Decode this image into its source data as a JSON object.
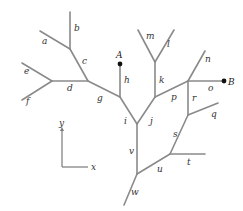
{
  "diagram": {
    "title": "",
    "colors": {
      "edge": "#8a8a8a",
      "point": "#111111",
      "text": "#333333"
    },
    "points": [
      {
        "id": "A",
        "label": "A",
        "x": 120,
        "y": 64,
        "lx": 116,
        "ly": 58
      },
      {
        "id": "B",
        "label": "B",
        "x": 224,
        "y": 81,
        "lx": 228,
        "ly": 85
      }
    ],
    "edges": [
      {
        "id": "a",
        "label": "a",
        "x1": 40,
        "y1": 31,
        "x2": 70,
        "y2": 49,
        "lx": 42,
        "ly": 44
      },
      {
        "id": "b",
        "label": "b",
        "x1": 70,
        "y1": 12,
        "x2": 70,
        "y2": 49,
        "lx": 74,
        "ly": 31
      },
      {
        "id": "c",
        "label": "c",
        "x1": 70,
        "y1": 49,
        "x2": 88,
        "y2": 81,
        "lx": 82,
        "ly": 64
      },
      {
        "id": "d",
        "label": "d",
        "x1": 52,
        "y1": 81,
        "x2": 88,
        "y2": 81,
        "lx": 67,
        "ly": 91
      },
      {
        "id": "e",
        "label": "e",
        "x1": 22,
        "y1": 63,
        "x2": 52,
        "y2": 81,
        "lx": 24,
        "ly": 74
      },
      {
        "id": "f",
        "label": "f",
        "x1": 22,
        "y1": 100,
        "x2": 52,
        "y2": 81,
        "lx": 26,
        "ly": 104
      },
      {
        "id": "g",
        "label": "g",
        "x1": 88,
        "y1": 81,
        "x2": 120,
        "y2": 97,
        "lx": 97,
        "ly": 101
      },
      {
        "id": "h",
        "label": "h",
        "x1": 120,
        "y1": 64,
        "x2": 120,
        "y2": 97,
        "lx": 124,
        "ly": 83
      },
      {
        "id": "i",
        "label": "i",
        "x1": 120,
        "y1": 97,
        "x2": 137,
        "y2": 124,
        "lx": 124,
        "ly": 124
      },
      {
        "id": "j",
        "label": "j",
        "x1": 155,
        "y1": 97,
        "x2": 137,
        "y2": 124,
        "lx": 150,
        "ly": 124
      },
      {
        "id": "k",
        "label": "k",
        "x1": 155,
        "y1": 62,
        "x2": 155,
        "y2": 97,
        "lx": 159,
        "ly": 83
      },
      {
        "id": "l",
        "label": "l",
        "x1": 174,
        "y1": 30,
        "x2": 155,
        "y2": 62,
        "lx": 167,
        "ly": 47
      },
      {
        "id": "m",
        "label": "m",
        "x1": 138,
        "y1": 30,
        "x2": 155,
        "y2": 62,
        "lx": 146,
        "ly": 39
      },
      {
        "id": "n",
        "label": "n",
        "x1": 205,
        "y1": 51,
        "x2": 188,
        "y2": 81,
        "lx": 205,
        "ly": 62
      },
      {
        "id": "o",
        "label": "o",
        "x1": 188,
        "y1": 81,
        "x2": 224,
        "y2": 81,
        "lx": 208,
        "ly": 91
      },
      {
        "id": "p",
        "label": "p",
        "x1": 155,
        "y1": 97,
        "x2": 188,
        "y2": 81,
        "lx": 171,
        "ly": 100
      },
      {
        "id": "q",
        "label": "q",
        "x1": 188,
        "y1": 115,
        "x2": 218,
        "y2": 103,
        "lx": 211,
        "ly": 117
      },
      {
        "id": "r",
        "label": "r",
        "x1": 188,
        "y1": 81,
        "x2": 188,
        "y2": 115,
        "lx": 192,
        "ly": 101
      },
      {
        "id": "s",
        "label": "s",
        "x1": 188,
        "y1": 115,
        "x2": 170,
        "y2": 154,
        "lx": 173,
        "ly": 137
      },
      {
        "id": "t",
        "label": "t",
        "x1": 170,
        "y1": 154,
        "x2": 205,
        "y2": 154,
        "lx": 187,
        "ly": 165
      },
      {
        "id": "u",
        "label": "u",
        "x1": 137,
        "y1": 174,
        "x2": 170,
        "y2": 154,
        "lx": 157,
        "ly": 172
      },
      {
        "id": "v",
        "label": "v",
        "x1": 137,
        "y1": 124,
        "x2": 137,
        "y2": 174,
        "lx": 129,
        "ly": 154
      },
      {
        "id": "w",
        "label": "w",
        "x1": 137,
        "y1": 174,
        "x2": 124,
        "y2": 205,
        "lx": 131,
        "ly": 195
      }
    ],
    "axes": {
      "origin": {
        "x": 62,
        "y": 167
      },
      "y_end": {
        "x": 62,
        "y": 127
      },
      "x_end": {
        "x": 88,
        "y": 167
      },
      "x_label": "x",
      "y_label": "y"
    }
  }
}
